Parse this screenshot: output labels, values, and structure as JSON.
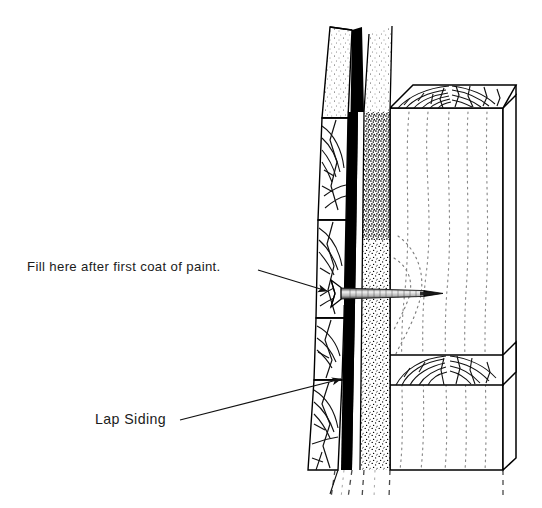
{
  "figure": {
    "type": "technical-line-drawing",
    "background_color": "#ffffff",
    "ink_color": "#000000",
    "text_color": "#1b1b1b",
    "width": 542,
    "height": 508
  },
  "annotations": {
    "fill_note": {
      "label": "Fill here after first coat of paint.",
      "text_x": 27,
      "text_y": 271,
      "leader_from_x": 258,
      "leader_from_y": 270,
      "leader_to_x": 327,
      "leader_to_y": 291,
      "arrow": "solid-triangle",
      "points_at": "nail-head"
    },
    "lap_siding_note": {
      "label": "Lap Siding",
      "text_x": 95,
      "text_y": 424,
      "leader_from_x": 180,
      "leader_from_y": 420,
      "leader_to_x": 341,
      "leader_to_y": 379,
      "arrow": "solid-triangle",
      "points_at": "siding-face"
    }
  },
  "components": {
    "lap_siding": {
      "name": "Lap Siding",
      "描述": "beveled wood siding boards in section with end-grain growth rings",
      "courses": 4,
      "edge_left_top_x": 330,
      "edge_left_bottom_x": 318
    },
    "sheathing": {
      "name": "Wall Sheathing",
      "texture": "stipple",
      "left_x": 363,
      "right_x": 390
    },
    "shadow_gap": {
      "name": "Shadow Line",
      "color": "#000000",
      "texture": "solid-black"
    },
    "stud": {
      "name": "Framing Stud",
      "texture": "dotted-grain",
      "top_face": "end-grain growth rings",
      "left_x": 390,
      "right_x": 516
    },
    "nail": {
      "name": "Siding Nail",
      "head": "countersunk",
      "orientation": "horizontal",
      "shank_start_x": 336,
      "shank_end_x": 430,
      "axis_y": 293
    },
    "break_lines": {
      "name": "Break Lines",
      "style": "dashed-vertical",
      "count": 5,
      "location": "bottom"
    }
  },
  "a11y": {
    "figure_description": "Cutaway technical drawing of lap siding nailed through sheathing into a framing stud, with a countersunk nail head to be filled after the first coat of paint."
  }
}
